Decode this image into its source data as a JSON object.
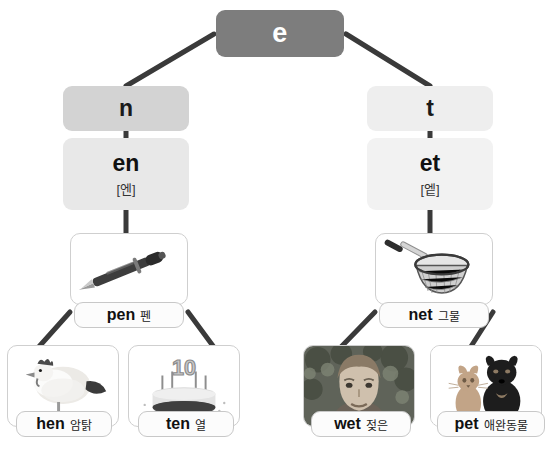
{
  "diagram": {
    "type": "phonics-word-family-tree",
    "root": {
      "letter": "e"
    },
    "branches": [
      {
        "id": "n-branch",
        "letter": "n",
        "rime": {
          "text": "en",
          "phonetic": "[엔]"
        },
        "primary": {
          "english": "pen",
          "korean": "펜",
          "image": "pen-illustration"
        },
        "children": [
          {
            "english": "hen",
            "korean": "암탉",
            "image": "hen-illustration"
          },
          {
            "english": "ten",
            "korean": "열",
            "image": "cake-ten-illustration"
          }
        ]
      },
      {
        "id": "t-branch",
        "letter": "t",
        "rime": {
          "text": "et",
          "phonetic": "[엩]"
        },
        "primary": {
          "english": "net",
          "korean": "그물",
          "image": "net-illustration"
        },
        "children": [
          {
            "english": "wet",
            "korean": "젖은",
            "image": "wet-boy-photo"
          },
          {
            "english": "pet",
            "korean": "애완동물",
            "image": "cat-and-dog-illustration"
          }
        ]
      }
    ],
    "colors": {
      "root_chip": "#7d7d7d",
      "root_text": "#ffffff",
      "letter_chip_n": "#d3d3d3",
      "letter_chip_t": "#eeeeee",
      "rime_chip": "#e8e8e8",
      "card_border": "#cfcfcf",
      "pill_background": "#fcfcfc",
      "connector": "#3a3a3a",
      "page_background": "#ffffff"
    }
  }
}
